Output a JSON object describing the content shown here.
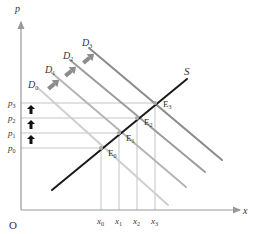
{
  "diagram": {
    "type": "supply-demand shift",
    "axes": {
      "y_label": "p",
      "x_label": "x",
      "origin_label": "O"
    },
    "supply": {
      "label": "S",
      "color": "#1a1a1a"
    },
    "demand_curves": [
      {
        "label": "D",
        "sub": "0",
        "color": "#c8c8c8"
      },
      {
        "label": "D",
        "sub": "1",
        "color": "#b0b0b0"
      },
      {
        "label": "D",
        "sub": "2",
        "color": "#999999"
      },
      {
        "label": "D",
        "sub": "3",
        "color": "#8a8a8a"
      }
    ],
    "equilibria": [
      {
        "label": "E",
        "sub": "0"
      },
      {
        "label": "E",
        "sub": "1"
      },
      {
        "label": "E",
        "sub": "2"
      },
      {
        "label": "E",
        "sub": "3"
      }
    ],
    "price_ticks": [
      {
        "label": "p",
        "sub": "0"
      },
      {
        "label": "p",
        "sub": "1"
      },
      {
        "label": "p",
        "sub": "2"
      },
      {
        "label": "p",
        "sub": "3"
      }
    ],
    "quantity_ticks": [
      {
        "label": "x",
        "sub": "0"
      },
      {
        "label": "x",
        "sub": "1"
      },
      {
        "label": "x",
        "sub": "2"
      },
      {
        "label": "x",
        "sub": "3"
      }
    ],
    "colors": {
      "axis": "#999999",
      "guide": "#bbbbbb",
      "shift_arrow": "#8c8c8c",
      "price_arrow": "#111111"
    }
  }
}
